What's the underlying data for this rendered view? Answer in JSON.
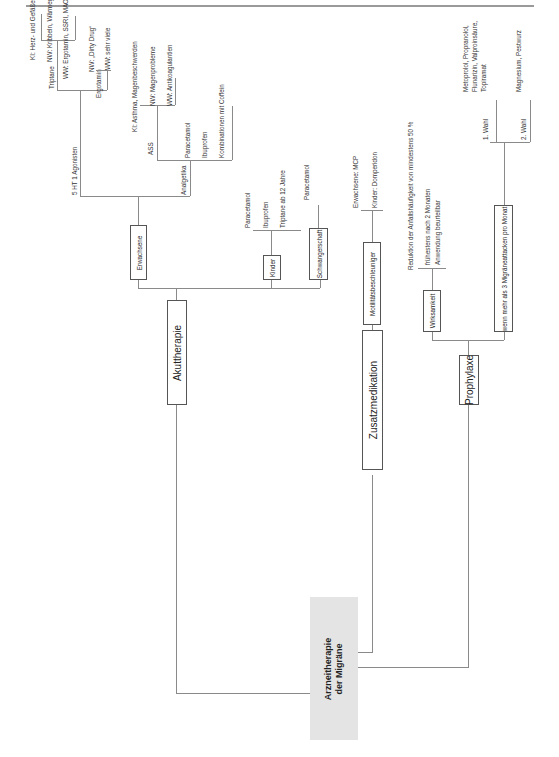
{
  "root": {
    "line1": "Arzneitherapie",
    "line2": "der Migräne"
  },
  "branches": {
    "akut": {
      "label": "Akuttherapie",
      "erwachsene": {
        "label": "Erwachsene",
        "agonisten": {
          "label": "5 HT 1 Agonisten",
          "triptane": {
            "label": "Triptane",
            "ki": "KI: Herz- und Gefäßerkrankungen",
            "nw": "NW: Kribbeln, Wärmegefühl",
            "ww": "WW: Ergotamin, SSRI, MAO-Hemmer"
          },
          "ergotamin": {
            "label": "Ergotamin",
            "nw": "NW: „Dirty Drug“",
            "ww": "WW: sehr viele"
          }
        },
        "analgetika": {
          "label": "Analgetika",
          "ass": {
            "label": "ASS",
            "ki": "KI: Asthma, Magenbeschwerden",
            "nw": "NW: Magenprobleme",
            "ww": "WW: Antikoagulantien"
          },
          "items": [
            "Paracetamol",
            "Ibuprofen",
            "Kombinationen mit Coffein"
          ]
        }
      },
      "kinder": {
        "label": "Kinder",
        "items": [
          "Paracetamol",
          "Ibuprofen",
          "Triptane ab 12 Jahre"
        ]
      },
      "schwangerschaft": {
        "label": "Schwangerschaft",
        "item": "Paracetamol"
      }
    },
    "zusatz": {
      "label": "Zusatzmedikation",
      "motilitaet": {
        "label": "Motilitätsbeschleuniger",
        "items": [
          "Erwachsene: MCP",
          "Kinder: Domperidon"
        ]
      }
    },
    "prophylaxe": {
      "label": "Prophylaxe",
      "wirksamkeit": {
        "label": "Wirksamkeit",
        "items": [
          "Reduktion der Anfallshäufigkeit von mindestens 50 %",
          "frühestens nach 2 Monaten",
          "Anwendung beurteilbar"
        ]
      },
      "indikation": {
        "label": "wenn mehr als 3 Migräneattacken pro Monat",
        "wahl1": {
          "label": "1. Wahl",
          "text1": "Metoprolol, Propranolol,",
          "text2": "Flunarizin, Valproinsäure,",
          "text3": "Topiramat"
        },
        "wahl2": {
          "label": "2. Wahl",
          "text": "Magnesium, Pestwurz"
        }
      }
    }
  }
}
